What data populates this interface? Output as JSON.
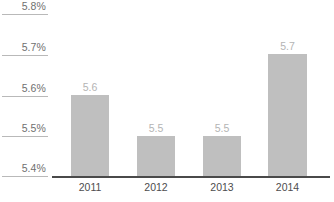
{
  "chart_data": {
    "type": "bar",
    "title": "",
    "subtitle": "",
    "xlabel": "",
    "ylabel": "",
    "categories": [
      "2011",
      "2012",
      "2013",
      "2014"
    ],
    "values": [
      5.6,
      5.5,
      5.5,
      5.7
    ],
    "value_labels": [
      "5.6",
      "5.5",
      "5.5",
      "5.7"
    ],
    "ylim": [
      5.4,
      5.8
    ],
    "ytick_values": [
      5.8,
      5.7,
      5.6,
      5.5,
      5.4
    ],
    "ytick_labels": [
      "5.8%",
      "5.7%",
      "5.6%",
      "5.5%",
      "5.4%"
    ],
    "grid": false,
    "legend": null,
    "legend_position": "none",
    "series": [
      {
        "name": "",
        "values": [
          5.6,
          5.5,
          5.5,
          5.7
        ]
      }
    ],
    "colors": {
      "bar_fill": "#bfbfbf",
      "axis_line": "#4a4a4a",
      "tick_line": "#b9b9b9",
      "ytick_label": "#6f6f6f",
      "xtick_label": "#4d4d4d",
      "value_label": "#b4b4b4",
      "background": "#ffffff"
    }
  }
}
